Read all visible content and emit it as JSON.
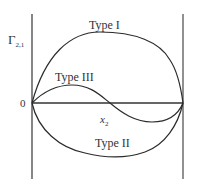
{
  "diagram": {
    "y_axis_label": "Γ",
    "y_axis_subscript": "2,1",
    "origin_label": "0",
    "x_axis_label": "x",
    "x_axis_subscript": "2",
    "curves": [
      {
        "name": "Type I",
        "label": "Type I",
        "shape": "positive arch, max near left-center"
      },
      {
        "name": "Type II",
        "label": "Type II",
        "shape": "negative arch, min near center"
      },
      {
        "name": "Type III",
        "label": "Type III",
        "shape": "sign change: positive then negative"
      }
    ],
    "colors": {
      "line": "#2b2b2b",
      "axis": "#444444",
      "background": "#ffffff"
    }
  }
}
